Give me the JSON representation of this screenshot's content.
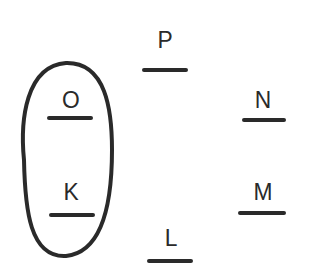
{
  "diagram": {
    "type": "hand-drawn-letter-nodes",
    "stroke_color": "#2a2a2a",
    "background": "#ffffff",
    "nodes": [
      {
        "id": "P",
        "label": "P",
        "x": 142,
        "y": 28,
        "underline": {
          "x": 142,
          "y": 68,
          "w": 46
        }
      },
      {
        "id": "O",
        "label": "O",
        "x": 48,
        "y": 88,
        "underline": {
          "x": 47,
          "y": 116,
          "w": 46
        }
      },
      {
        "id": "N",
        "label": "N",
        "x": 240,
        "y": 88,
        "underline": {
          "x": 242,
          "y": 118,
          "w": 44
        }
      },
      {
        "id": "K",
        "label": "K",
        "x": 48,
        "y": 180,
        "underline": {
          "x": 49,
          "y": 213,
          "w": 46
        }
      },
      {
        "id": "M",
        "label": "M",
        "x": 240,
        "y": 180,
        "underline": {
          "x": 238,
          "y": 211,
          "w": 48
        }
      },
      {
        "id": "L",
        "label": "L",
        "x": 148,
        "y": 226,
        "underline": {
          "x": 147,
          "y": 259,
          "w": 46
        }
      }
    ],
    "groups": [
      {
        "name": "oval-group",
        "members": [
          "O",
          "K"
        ],
        "shape": "oval",
        "bounds": {
          "x": 21,
          "y": 62,
          "w": 94,
          "h": 196
        }
      }
    ]
  }
}
